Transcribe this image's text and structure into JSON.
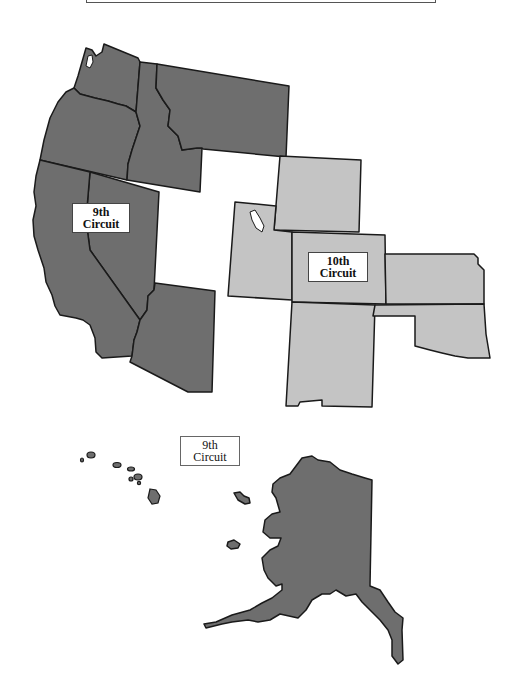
{
  "colors": {
    "ninth_fill": "#6e6e6e",
    "tenth_fill": "#c4c4c4",
    "border": "#1a1a1a",
    "background": "#ffffff"
  },
  "labels": {
    "ninth_mainland": {
      "line1": "9th",
      "line2": "Circuit"
    },
    "tenth": {
      "line1": "10th",
      "line2": "Circuit"
    },
    "ninth_pacific": {
      "line1": "9th",
      "line2": "Circuit"
    }
  },
  "regions": {
    "ninth_circuit": [
      "Washington",
      "Oregon",
      "Idaho",
      "Montana",
      "California",
      "Nevada",
      "Arizona",
      "Alaska",
      "Hawaii"
    ],
    "tenth_circuit": [
      "Wyoming",
      "Utah",
      "Colorado",
      "Kansas",
      "New Mexico",
      "Oklahoma"
    ]
  }
}
